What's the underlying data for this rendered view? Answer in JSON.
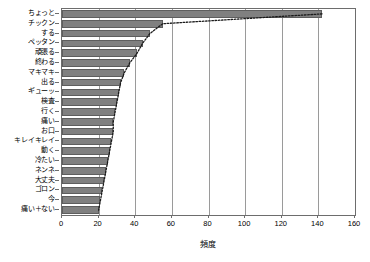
{
  "chart_data": {
    "type": "bar",
    "orientation": "horizontal",
    "title": "",
    "subtitle": "",
    "xlabel": "頻度",
    "ylabel": "",
    "xlim": [
      0,
      160
    ],
    "ylim": null,
    "grid": true,
    "legend": null,
    "xticks": [
      0,
      20,
      40,
      60,
      80,
      100,
      120,
      140,
      160
    ],
    "xticklabels": [
      "0",
      "20",
      "40",
      "60",
      "80",
      "100",
      "120",
      "140",
      "160"
    ],
    "categories": [
      "ちょっと",
      "チックン",
      "する",
      "ペッタン",
      "頑張る",
      "終わる",
      "マキマキ",
      "出る",
      "ギューッ",
      "検査",
      "行く",
      "痛い",
      "お口",
      "キレイキレイ",
      "動く",
      "冷たい",
      "ネンネ",
      "大丈夫",
      "ゴロン",
      "今",
      "痛い＋ない"
    ],
    "values": [
      142,
      55,
      48,
      44,
      41,
      37,
      34,
      32,
      31,
      30,
      29,
      28,
      28,
      27,
      26,
      25,
      24,
      23,
      22,
      21,
      20
    ],
    "series": [
      {
        "name": "頻度",
        "type": "bar",
        "color": "#808080",
        "values": [
          142,
          55,
          48,
          44,
          41,
          37,
          34,
          32,
          31,
          30,
          29,
          28,
          28,
          27,
          26,
          25,
          24,
          23,
          22,
          21,
          20
        ]
      },
      {
        "name": "cumulative-curve",
        "type": "line",
        "style": "dotted",
        "color": "#1a1a1a",
        "values": [
          142,
          55,
          48,
          44,
          41,
          37,
          34,
          32,
          31,
          30,
          29,
          28,
          28,
          27,
          26,
          25,
          24,
          23,
          22,
          21,
          20
        ]
      }
    ]
  },
  "axis": {
    "x_title": "頻度",
    "frame_color": "#6d6d6d",
    "grid_color": "#9a9a9a",
    "bar_fill": "#808080",
    "bar_edge": "#5e5e5e",
    "line_color": "#1a1a1a"
  }
}
